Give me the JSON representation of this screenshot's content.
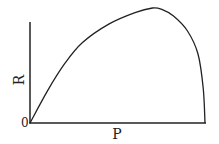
{
  "chart_data": {
    "type": "line",
    "title": "",
    "xlabel": "P",
    "ylabel": "R",
    "origin_label": "0",
    "x": [
      0,
      0.1,
      0.2,
      0.3,
      0.45,
      0.6,
      0.7,
      0.75,
      0.82,
      0.9,
      0.96,
      0.99,
      1.0
    ],
    "series": [
      {
        "name": "R vs P",
        "values": [
          0,
          0.28,
          0.52,
          0.7,
          0.86,
          0.96,
          1.0,
          0.99,
          0.93,
          0.8,
          0.6,
          0.3,
          0
        ]
      }
    ],
    "xlim": [
      0,
      1
    ],
    "ylim": [
      0,
      1.15
    ],
    "grid": false,
    "legend": "none",
    "colors": {
      "line": "#222222",
      "axis": "#222222"
    }
  }
}
